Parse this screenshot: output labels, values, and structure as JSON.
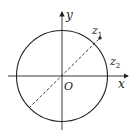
{
  "diagram": {
    "type": "complex-plane-unit-circle",
    "axes": {
      "x_label": "x",
      "y_label": "y",
      "origin_label": "O"
    },
    "points": [
      {
        "label": "z",
        "subscript": "1",
        "description": "point outside circle on dashed diameter line"
      },
      {
        "label": "z",
        "subscript": "2",
        "description": "label near circle right side"
      }
    ],
    "colors": {
      "stroke": "#222222",
      "background": "#ffffff"
    }
  }
}
